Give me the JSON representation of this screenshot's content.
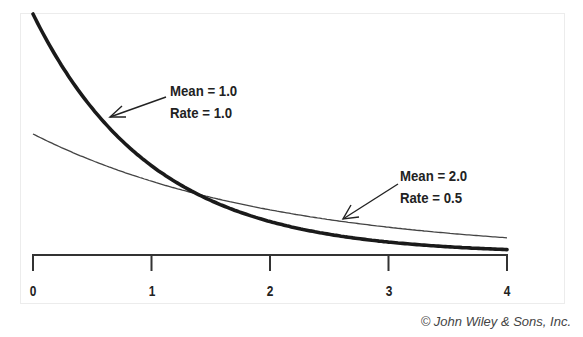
{
  "chart_data": {
    "type": "line",
    "title": "",
    "xlabel": "",
    "ylabel": "",
    "xlim": [
      0,
      4
    ],
    "ylim": [
      0,
      1
    ],
    "x_ticks": [
      "0",
      "1",
      "2",
      "3",
      "4"
    ],
    "grid": false,
    "legend": "none (inline annotations with arrows)",
    "series": [
      {
        "name": "Mean = 1.0, Rate = 1.0",
        "function": "exponential pdf f(x) = 1.0 * exp(-1.0 x)",
        "line": "thick",
        "x": [
          0,
          0.5,
          1,
          1.5,
          2,
          2.5,
          3,
          3.5,
          4
        ],
        "values": [
          1.0,
          0.607,
          0.368,
          0.223,
          0.135,
          0.082,
          0.05,
          0.03,
          0.018
        ]
      },
      {
        "name": "Mean = 2.0, Rate = 0.5",
        "function": "exponential pdf f(x) = 0.5 * exp(-0.5 x)",
        "line": "thin",
        "x": [
          0,
          0.5,
          1,
          1.5,
          2,
          2.5,
          3,
          3.5,
          4
        ],
        "values": [
          0.5,
          0.389,
          0.303,
          0.236,
          0.184,
          0.143,
          0.112,
          0.087,
          0.068
        ]
      }
    ],
    "annotations": [
      {
        "lines": [
          "Mean = 1.0",
          "Rate = 1.0"
        ],
        "points_to": "thick curve near x=0.6"
      },
      {
        "lines": [
          "Mean = 2.0",
          "Rate = 0.5"
        ],
        "points_to": "thin curve near x=2.3"
      }
    ]
  },
  "labels": {
    "ticks": [
      "0",
      "1",
      "2",
      "3",
      "4"
    ],
    "annot1_line1": "Mean = 1.0",
    "annot1_line2": "Rate = 1.0",
    "annot2_line1": "Mean = 2.0",
    "annot2_line2": "Rate = 0.5",
    "credit": "© John Wiley & Sons, Inc."
  }
}
